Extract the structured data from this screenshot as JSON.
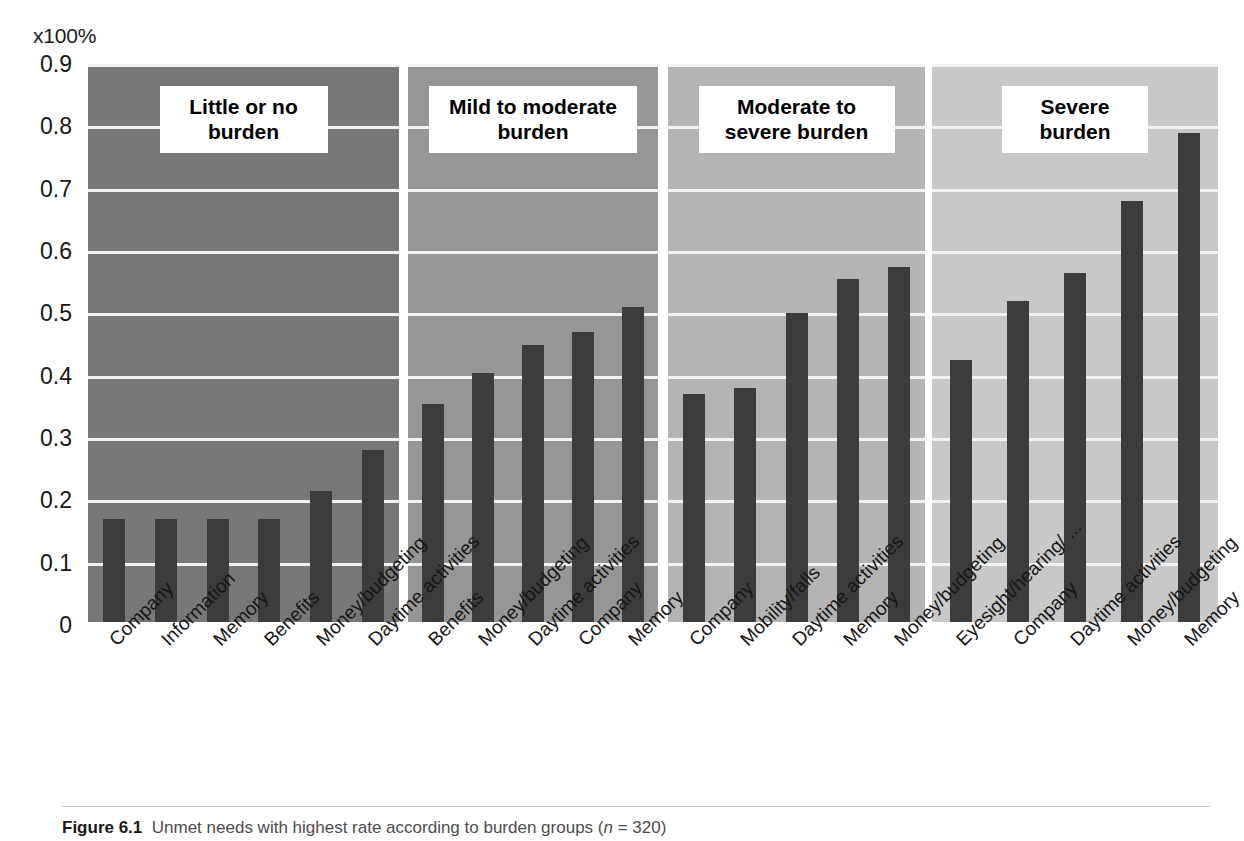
{
  "figure": {
    "unit_label": "x100%",
    "caption_number": "Figure 6.1",
    "caption_text": "Unmet needs with highest rate according to burden groups (",
    "caption_italic": "n",
    "caption_tail": " = 320)"
  },
  "colors": {
    "bar": "#3c3c3c",
    "gridline": "#f2f2f2",
    "panel1_bg": "#787878",
    "panel2_bg": "#969696",
    "panel3_bg": "#b4b4b4",
    "panel4_bg": "#c8c8c8",
    "title_box_bg": "#ffffff",
    "text": "#161616"
  },
  "chart_data": {
    "type": "bar",
    "title": "Unmet needs with highest rate according to burden groups (n = 320)",
    "xlabel": "",
    "ylabel": "x100%",
    "ylim": [
      0,
      0.9
    ],
    "yticks": [
      "0",
      "0.1",
      "0.2",
      "0.3",
      "0.4",
      "0.5",
      "0.6",
      "0.7",
      "0.8",
      "0.9"
    ],
    "ytick_values": [
      0,
      0.1,
      0.2,
      0.3,
      0.4,
      0.5,
      0.6,
      0.7,
      0.8,
      0.9
    ],
    "grid": true,
    "legend": "none",
    "panels": [
      {
        "title": "Little or no burden",
        "title_line1": "Little or no",
        "title_line2": "burden",
        "categories": [
          "Company",
          "Information",
          "Memory",
          "Benefits",
          "Money/budgeting",
          "Daytime activities"
        ],
        "values": [
          0.17,
          0.17,
          0.17,
          0.17,
          0.215,
          0.28
        ]
      },
      {
        "title": "Mild to moderate burden",
        "title_line1": "Mild to moderate",
        "title_line2": "burden",
        "categories": [
          "Benefits",
          "Money/budgeting",
          "Daytime activities",
          "Company",
          "Memory"
        ],
        "values": [
          0.355,
          0.405,
          0.45,
          0.47,
          0.51
        ]
      },
      {
        "title": "Moderate to severe burden",
        "title_line1": "Moderate to",
        "title_line2": "severe burden",
        "categories": [
          "Company",
          "Mobility/falls",
          "Daytime activities",
          "Memory",
          "Money/budgeting"
        ],
        "values": [
          0.37,
          0.38,
          0.5,
          0.555,
          0.575
        ]
      },
      {
        "title": "Severe burden",
        "title_line1": "Severe",
        "title_line2": "burden",
        "categories": [
          "Eyesight/hearing/ ...",
          "Company",
          "Daytime activities",
          "Money/budgeting",
          "Memory"
        ],
        "values": [
          0.425,
          0.52,
          0.565,
          0.68,
          0.79
        ]
      }
    ]
  }
}
